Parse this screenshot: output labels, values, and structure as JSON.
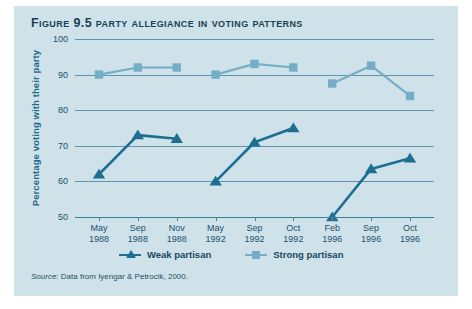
{
  "figure": {
    "title": "Figure 9.5 Party Allegiance in Voting Patterns",
    "source_label": "Source:",
    "source_text": " Data from Iyengar & Petrocik, 2000.",
    "panel_color": "#cfe2ea",
    "title_color": "#1c3f55"
  },
  "chart_data": {
    "type": "line",
    "title": "Party Allegiance in Voting Patterns",
    "xlabel": "",
    "ylabel": "Percentage voting with their party",
    "ylim": [
      50,
      100
    ],
    "yticks": [
      50,
      60,
      70,
      80,
      90,
      100
    ],
    "grid": true,
    "legend_position": "bottom",
    "categories": [
      "May 1988",
      "Sep 1988",
      "Nov 1988",
      "May 1992",
      "Sep 1992",
      "Oct 1992",
      "Feb 1996",
      "Sep 1996",
      "Oct 1996"
    ],
    "x_tick_labels": [
      {
        "month": "May",
        "year": "1988"
      },
      {
        "month": "Sep",
        "year": "1988"
      },
      {
        "month": "Nov",
        "year": "1988"
      },
      {
        "month": "May",
        "year": "1992"
      },
      {
        "month": "Sep",
        "year": "1992"
      },
      {
        "month": "Oct",
        "year": "1992"
      },
      {
        "month": "Feb",
        "year": "1996"
      },
      {
        "month": "Sep",
        "year": "1996"
      },
      {
        "month": "Oct",
        "year": "1996"
      }
    ],
    "series": [
      {
        "name": "Weak partisan",
        "color": "#1d6e91",
        "marker": "triangle",
        "values": [
          62,
          73,
          72,
          60,
          71,
          75,
          50,
          63.5,
          66.5
        ]
      },
      {
        "name": "Strong partisan",
        "color": "#74aec6",
        "marker": "square",
        "values": [
          90,
          92,
          92,
          90,
          93,
          92,
          87.5,
          92.5,
          84
        ]
      }
    ],
    "breaks_after_index": [
      2,
      5
    ]
  },
  "legend": {
    "items": [
      {
        "label": "Weak partisan",
        "color": "#1d6e91",
        "marker": "triangle"
      },
      {
        "label": "Strong partisan",
        "color": "#74aec6",
        "marker": "square"
      }
    ]
  }
}
